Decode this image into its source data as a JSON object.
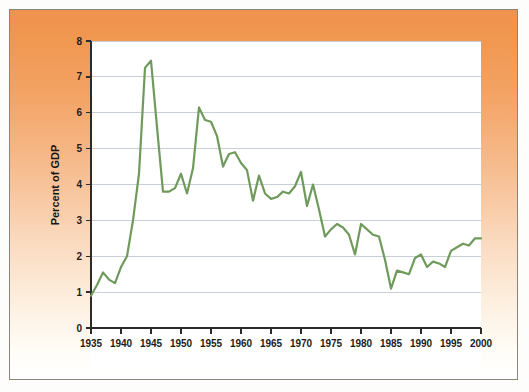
{
  "figure": {
    "background_top_color": "#ef9250",
    "background_bottom_color": "#ffffff",
    "plot_background_color": "#ffffff",
    "border_color": "#8a8578"
  },
  "chart_data": {
    "type": "line",
    "title": "",
    "subtitle": "",
    "xlabel": "",
    "ylabel": "Percent of GDP",
    "xlim": [
      1935,
      2000
    ],
    "ylim": [
      0,
      8
    ],
    "grid": true,
    "grid_axis": "y",
    "legend": false,
    "legend_position": "none",
    "line_color": "#6f9a5c",
    "y_ticks": [
      0,
      1,
      2,
      3,
      4,
      5,
      6,
      7,
      8
    ],
    "y_tick_labels": [
      "0",
      "1",
      "2",
      "3",
      "4",
      "5",
      "6",
      "7",
      "8"
    ],
    "x_ticks": [
      1935,
      1940,
      1945,
      1950,
      1955,
      1960,
      1965,
      1970,
      1975,
      1980,
      1985,
      1990,
      1995,
      2000
    ],
    "x_tick_labels": [
      "1935",
      "1940",
      "1945",
      "1950",
      "1955",
      "1960",
      "1965",
      "1970",
      "1975",
      "1980",
      "1985",
      "1990",
      "1995",
      "2000"
    ],
    "x": [
      1935,
      1936,
      1937,
      1938,
      1939,
      1940,
      1941,
      1942,
      1943,
      1944,
      1945,
      1946,
      1947,
      1948,
      1949,
      1950,
      1951,
      1952,
      1953,
      1954,
      1955,
      1956,
      1957,
      1958,
      1959,
      1960,
      1961,
      1962,
      1963,
      1964,
      1965,
      1966,
      1967,
      1968,
      1969,
      1970,
      1971,
      1972,
      1973,
      1974,
      1975,
      1976,
      1977,
      1978,
      1979,
      1980,
      1981,
      1982,
      1983,
      1984,
      1985,
      1986,
      1987,
      1988,
      1989,
      1990,
      1991,
      1992,
      1993,
      1994,
      1995,
      1996,
      1997,
      1998,
      1999,
      2000
    ],
    "series": [
      {
        "name": "Percent of GDP",
        "color": "#6f9a5c",
        "values": [
          0.9,
          1.2,
          1.55,
          1.35,
          1.25,
          1.7,
          2.0,
          3.0,
          4.3,
          7.25,
          7.45,
          5.6,
          3.8,
          3.8,
          3.9,
          4.3,
          3.75,
          4.45,
          6.15,
          5.8,
          5.75,
          5.35,
          4.5,
          4.85,
          4.9,
          4.6,
          4.4,
          3.55,
          4.25,
          3.75,
          3.6,
          3.65,
          3.8,
          3.75,
          3.95,
          4.35,
          3.4,
          4.0,
          3.3,
          2.55,
          2.75,
          2.9,
          2.8,
          2.6,
          2.05,
          2.9,
          2.75,
          2.6,
          2.55,
          1.9,
          1.1,
          1.6,
          1.55,
          1.5,
          1.95,
          2.05,
          1.7,
          1.85,
          1.8,
          1.7,
          2.15,
          2.25,
          2.35,
          2.3,
          2.5,
          2.5
        ]
      }
    ]
  }
}
